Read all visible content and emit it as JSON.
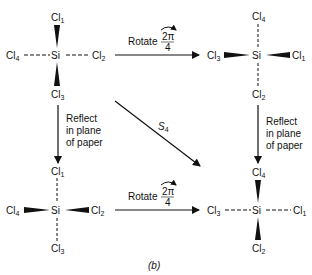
{
  "figure": {
    "caption": "(b)",
    "colors": {
      "ink": "#111111",
      "background": "#ffffff"
    }
  },
  "molecules": [
    {
      "id": "top-left",
      "center": "Si",
      "top": {
        "atom": "Cl",
        "index": "1",
        "bond": "wedge"
      },
      "bottom": {
        "atom": "Cl",
        "index": "3",
        "bond": "wedge"
      },
      "left": {
        "atom": "Cl",
        "index": "4",
        "bond": "dashed"
      },
      "right": {
        "atom": "Cl",
        "index": "2",
        "bond": "dashed"
      }
    },
    {
      "id": "top-right",
      "center": "Si",
      "top": {
        "atom": "Cl",
        "index": "4",
        "bond": "dashed"
      },
      "bottom": {
        "atom": "Cl",
        "index": "2",
        "bond": "dashed"
      },
      "left": {
        "atom": "Cl",
        "index": "3",
        "bond": "wedge"
      },
      "right": {
        "atom": "Cl",
        "index": "1",
        "bond": "wedge"
      }
    },
    {
      "id": "bottom-left",
      "center": "Si",
      "top": {
        "atom": "Cl",
        "index": "1",
        "bond": "dashed"
      },
      "bottom": {
        "atom": "Cl",
        "index": "3",
        "bond": "dashed"
      },
      "left": {
        "atom": "Cl",
        "index": "4",
        "bond": "wedge"
      },
      "right": {
        "atom": "Cl",
        "index": "2",
        "bond": "wedge"
      }
    },
    {
      "id": "bottom-right",
      "center": "Si",
      "top": {
        "atom": "Cl",
        "index": "4",
        "bond": "wedge"
      },
      "bottom": {
        "atom": "Cl",
        "index": "2",
        "bond": "wedge"
      },
      "left": {
        "atom": "Cl",
        "index": "3",
        "bond": "dashed"
      },
      "right": {
        "atom": "Cl",
        "index": "1",
        "bond": "dashed"
      }
    }
  ],
  "arrows": {
    "rotate_top": {
      "label": "Rotate",
      "numerator": "2π",
      "denominator": "4"
    },
    "rotate_bottom": {
      "label": "Rotate",
      "numerator": "2π",
      "denominator": "4"
    },
    "reflect_left": {
      "lines": [
        "Reflect",
        "in plane",
        "of paper"
      ]
    },
    "reflect_right": {
      "lines": [
        "Reflect",
        "in plane",
        "of paper"
      ]
    },
    "diagonal": {
      "label": "S",
      "subscript": "4"
    }
  }
}
